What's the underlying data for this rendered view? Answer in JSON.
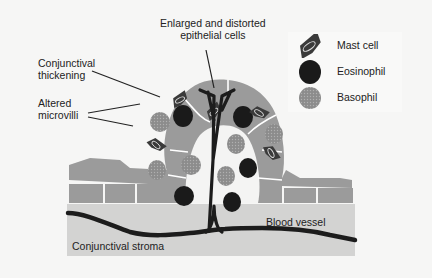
{
  "diagram": {
    "labels": {
      "enlarged_cells_line1": "Enlarged and distorted",
      "enlarged_cells_line2": "epithelial cells",
      "conj_thickening_line1": "Conjunctival",
      "conj_thickening_line2": "thickening",
      "altered_microvilli_line1": "Altered",
      "altered_microvilli_line2": "microvilli",
      "blood_vessel": "Blood vessel",
      "conj_stroma": "Conjunctival stroma"
    },
    "legend": {
      "items": [
        {
          "icon": "mast-cell-icon",
          "label": "Mast cell"
        },
        {
          "icon": "eosinophil-icon",
          "label": "Eosinophil"
        },
        {
          "icon": "basophil-icon",
          "label": "Basophil"
        }
      ]
    },
    "colors": {
      "background": "#f6f6f5",
      "stroma": "#d3d3d2",
      "epithelium": "#9b9b9b",
      "cell_border": "#ffffff",
      "vessel": "#1c1c1c",
      "eosinophil": "#1a1a1a",
      "basophil": "#8a8a8a",
      "mast_cell": "#3a3a3a"
    }
  }
}
